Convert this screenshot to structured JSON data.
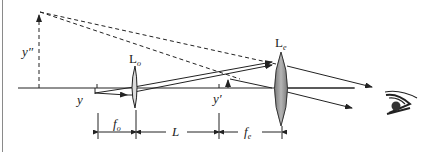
{
  "diagram": {
    "labels": {
      "objective_lens": "L",
      "objective_lens_sub": "o",
      "eyepiece_lens": "L",
      "eyepiece_lens_sub": "e",
      "object_height": "y",
      "intermediate_image_height": "y′",
      "final_image_height": "y″",
      "focal_objective": "f",
      "focal_objective_sub": "o",
      "tube_length": "L",
      "focal_eyepiece": "f",
      "focal_eyepiece_sub": "e"
    },
    "icons": {
      "eye": "eye-icon"
    },
    "colors": {
      "line": "#222222",
      "lens_objective_fill": "#d9d9d9",
      "lens_eyepiece_fill": "#9a9a9a",
      "background": "#ffffff"
    }
  }
}
